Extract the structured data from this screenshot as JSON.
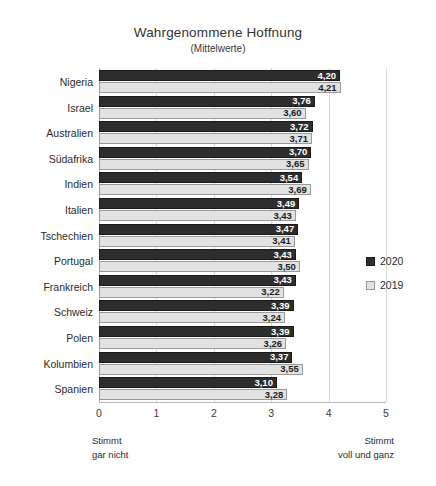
{
  "chart_data": {
    "type": "bar",
    "orientation": "horizontal",
    "title": "Wahrgenommene Hoffnung",
    "subtitle": "(Mittelwerte)",
    "xlabel": "",
    "ylabel": "",
    "xlim": [
      0,
      5
    ],
    "xticks": [
      "0",
      "1",
      "2",
      "3",
      "4",
      "5"
    ],
    "grid": true,
    "legend_position": "right",
    "categories": [
      "Nigeria",
      "Israel",
      "Australien",
      "Südafrika",
      "Indien",
      "Italien",
      "Tschechien",
      "Portugal",
      "Frankreich",
      "Schweiz",
      "Polen",
      "Kolumbien",
      "Spanien"
    ],
    "series": [
      {
        "name": "2020",
        "color": "#2d2d2d",
        "values": [
          4.2,
          3.76,
          3.72,
          3.7,
          3.54,
          3.49,
          3.47,
          3.43,
          3.43,
          3.39,
          3.39,
          3.37,
          3.1
        ],
        "labels": [
          "4,20",
          "3,76",
          "3,72",
          "3,70",
          "3,54",
          "3,49",
          "3,47",
          "3,43",
          "3,43",
          "3,39",
          "3,39",
          "3,37",
          "3,10"
        ]
      },
      {
        "name": "2019",
        "color": "#e2e2e2",
        "values": [
          4.21,
          3.6,
          3.71,
          3.65,
          3.69,
          3.43,
          3.41,
          3.5,
          3.22,
          3.24,
          3.26,
          3.55,
          3.28
        ],
        "labels": [
          "4,21",
          "3,60",
          "3,71",
          "3,65",
          "3,69",
          "3,43",
          "3,41",
          "3,50",
          "3,22",
          "3,24",
          "3,26",
          "3,55",
          "3,28"
        ]
      }
    ],
    "anchors": {
      "low_line1": "Stimmt",
      "low_line2": "gar nicht",
      "high_line1": "Stimmt",
      "high_line2": "voll und ganz"
    }
  }
}
